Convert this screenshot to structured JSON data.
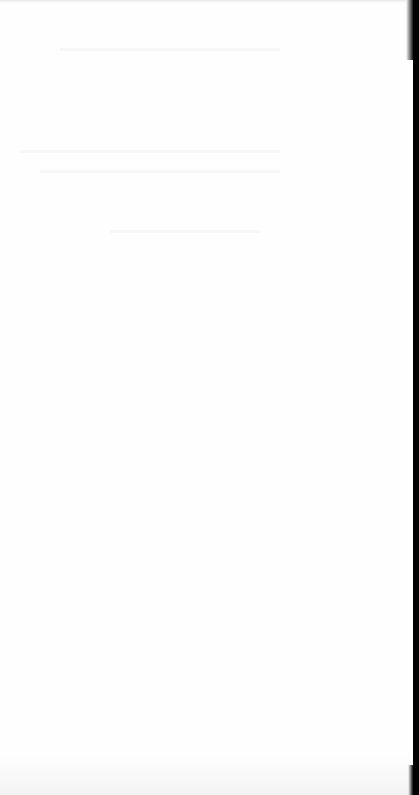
{
  "page": {
    "type": "blank-scanned-page",
    "background_color": "#fefefe",
    "edge_color": "#000000",
    "visible_text": ""
  }
}
